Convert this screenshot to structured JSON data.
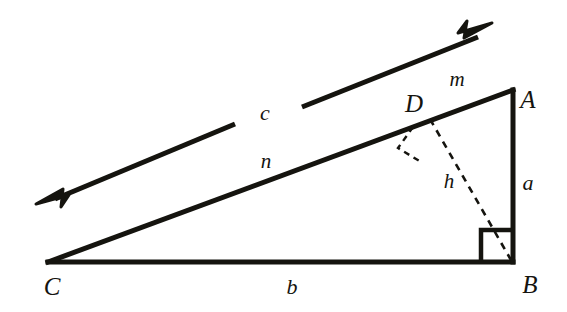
{
  "figure": {
    "width": 567,
    "height": 312,
    "background_color": "#ffffff",
    "stroke_color": "#15140f",
    "solid_stroke_width": 5,
    "dashed_stroke_width": 2.4,
    "dash_pattern": "7,6"
  },
  "vertices": {
    "A": {
      "label": "A",
      "x": 513,
      "y": 90,
      "label_x": 528,
      "label_y": 99,
      "role": "top-right apex"
    },
    "B": {
      "label": "B",
      "x": 513,
      "y": 262,
      "label_x": 530,
      "label_y": 284,
      "role": "right angle vertex"
    },
    "C": {
      "label": "C",
      "x": 48,
      "y": 262,
      "label_x": 52,
      "label_y": 286,
      "role": "bottom-left vertex"
    },
    "D": {
      "label": "D",
      "x": 430,
      "y": 119,
      "label_x": 414,
      "label_y": 103,
      "role": "foot of altitude on hypotenuse"
    }
  },
  "sides": [
    {
      "name": "a",
      "label": "a",
      "from": "B",
      "to": "A",
      "label_x": 528,
      "label_y": 183,
      "description": "vertical leg BA"
    },
    {
      "name": "b",
      "label": "b",
      "from": "C",
      "to": "B",
      "label_x": 292,
      "label_y": 287,
      "description": "horizontal leg CB"
    },
    {
      "name": "n",
      "label": "n",
      "from": "C",
      "to": "D",
      "label_x": 266,
      "label_y": 161,
      "description": "hypotenuse segment CD"
    },
    {
      "name": "m",
      "label": "m",
      "from": "D",
      "to": "A",
      "label_x": 457,
      "label_y": 79,
      "description": "hypotenuse segment DA"
    },
    {
      "name": "h",
      "label": "h",
      "from": "D",
      "to": "B",
      "label_x": 449,
      "label_y": 181,
      "description": "altitude DB (dashed)"
    }
  ],
  "arrow_line": {
    "name": "c",
    "label": "c",
    "label_x": 265,
    "label_y": 113,
    "description": "double-headed arrow line parallel to hypotenuse, broken by the label",
    "segment_lower": {
      "x1": 48,
      "y1": 198,
      "x2": 235,
      "y2": 124
    },
    "segment_upper": {
      "x1": 302,
      "y1": 107,
      "x2": 481,
      "y2": 36
    },
    "arrowhead_left": {
      "tip_x": 38,
      "tip_y": 202,
      "direction": "down-left"
    },
    "arrowhead_right": {
      "tip_x": 490,
      "tip_y": 25,
      "direction": "up-right"
    },
    "arrowhead_size": 19
  },
  "right_angle_markers": [
    {
      "name": "right-angle-at-B",
      "at_vertex": "B",
      "style": "solid",
      "size": 32,
      "points": "481,262 481,230 513,230"
    },
    {
      "name": "right-angle-at-D",
      "at_vertex": "D",
      "style": "dashed",
      "size": 22,
      "points": "414,128 400,149 424,161"
    }
  ]
}
